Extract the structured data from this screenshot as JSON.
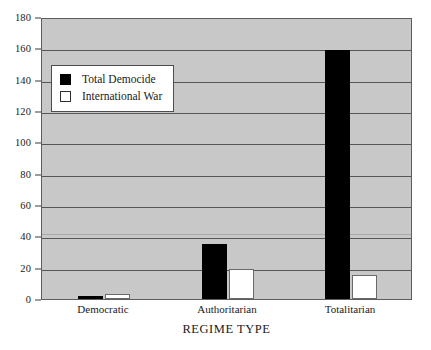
{
  "chart_data": {
    "type": "bar",
    "title": "",
    "subtitle": "",
    "xlabel": "REGIME TYPE",
    "ylabel": "",
    "categories": [
      "Democratic",
      "Authoritarian",
      "Totalitarian"
    ],
    "series": [
      {
        "name": "Total Democide",
        "color": "#000000",
        "values": [
          2,
          35,
          159
        ]
      },
      {
        "name": "International War",
        "color": "#ffffff",
        "values": [
          3,
          19,
          15
        ]
      }
    ],
    "ylim": [
      0,
      180
    ],
    "ytick_step": 20,
    "yticks": [
      0,
      20,
      40,
      60,
      80,
      100,
      120,
      140,
      160,
      180
    ],
    "ytick_labels": [
      "0",
      "20",
      "40",
      "60",
      "80",
      "100",
      "120",
      "140",
      "160",
      "180"
    ],
    "grid": true,
    "grid_axis": "y",
    "legend_position": "upper-left-inside",
    "plot_background": "#c8c8c8",
    "figure_background": "#ffffff",
    "axis_color": "#5e5e5e",
    "gridline_color": "#565656"
  },
  "legend": {
    "entries": [
      {
        "label": "Total Democide",
        "swatch": "black-square-swatch"
      },
      {
        "label": "International War",
        "swatch": "white-square-swatch"
      }
    ]
  }
}
